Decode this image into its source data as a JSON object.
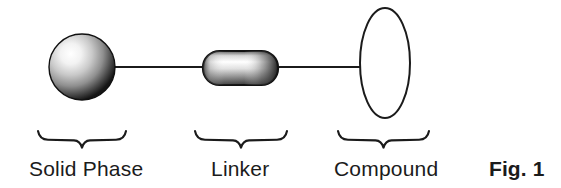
{
  "figure": {
    "number_label": "Fig. 1",
    "background_color": "#ffffff",
    "stroke_color": "#1b1b1b",
    "text_color": "#1b1b1b",
    "width": 561,
    "height": 188
  },
  "components": [
    {
      "id": "solid-phase",
      "label": "Solid Phase",
      "shape": "sphere",
      "fill": "gradient-gray",
      "highlight_color": "#ffffff",
      "shadow_color": "#111111",
      "center_x": 82,
      "center_y": 67,
      "radius": 33
    },
    {
      "id": "linker",
      "label": "Linker",
      "shape": "rounded-rectangle",
      "fill": "gradient-gray",
      "highlight_color": "#ffffff",
      "shadow_color": "#1a1a1a",
      "x": 203,
      "y": 51,
      "width": 75,
      "height": 34,
      "corner_radius": 16
    },
    {
      "id": "compound",
      "label": "Compound",
      "shape": "ellipse",
      "fill": "#ffffff",
      "stroke": "#1b1b1b",
      "center_x": 385,
      "center_y": 63,
      "radius_x": 25,
      "radius_y": 55
    }
  ],
  "connectors": [
    {
      "id": "solid-phase-to-linker",
      "x1": 113,
      "y1": 67,
      "x2": 204,
      "y2": 67
    },
    {
      "id": "linker-to-compound",
      "x1": 277,
      "y1": 67,
      "x2": 361,
      "y2": 67
    }
  ],
  "braces": [
    {
      "id": "brace-solid-phase",
      "x_start": 38,
      "x_end": 126,
      "y": 131,
      "points_to": "solid-phase"
    },
    {
      "id": "brace-linker",
      "x_start": 195,
      "x_end": 287,
      "y": 131,
      "points_to": "linker"
    },
    {
      "id": "brace-compound",
      "x_start": 338,
      "x_end": 429,
      "y": 131,
      "points_to": "compound"
    }
  ]
}
